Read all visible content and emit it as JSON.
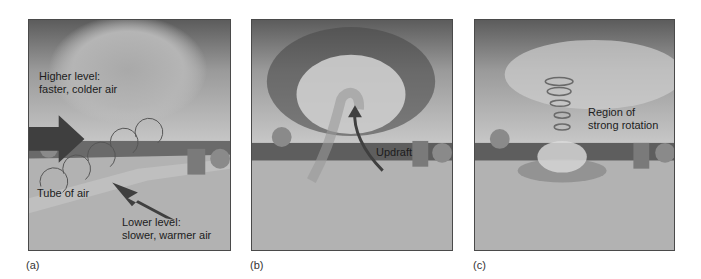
{
  "figure": {
    "panels": [
      {
        "id": "a",
        "label": "(a)",
        "annotations": {
          "higher_level_line1": "Higher level:",
          "higher_level_line2": "faster, colder air",
          "tube": "Tube of air",
          "lower_level_line1": "Lower level:",
          "lower_level_line2": "slower, warmer air"
        }
      },
      {
        "id": "b",
        "label": "(b)",
        "annotations": {
          "updraft": "Updraft"
        }
      },
      {
        "id": "c",
        "label": "(c)",
        "annotations": {
          "rotation_line1": "Region of",
          "rotation_line2": "strong rotation"
        }
      }
    ],
    "colors": {
      "arrow": "#3f3f3f",
      "sky_top": "#5c5c5c",
      "ground": "#b4b4b4",
      "treeline": "#6a6a6a"
    }
  }
}
